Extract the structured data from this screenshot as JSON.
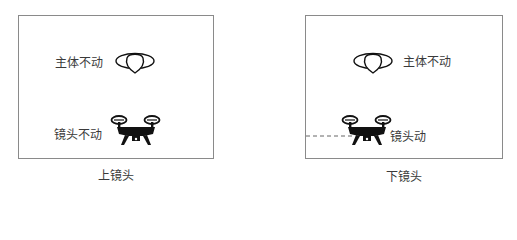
{
  "left_panel": {
    "subject_label": "主体不动",
    "camera_label": "镜头不动",
    "caption": "上镜头"
  },
  "right_panel": {
    "subject_label": "主体不动",
    "camera_label": "镜头动",
    "caption": "下镜头"
  },
  "icons": {
    "subject": "subject-icon",
    "drone": "drone-icon"
  },
  "colors": {
    "border": "#8a8a8a",
    "icon": "#111111",
    "dashed_line": "#666666"
  }
}
